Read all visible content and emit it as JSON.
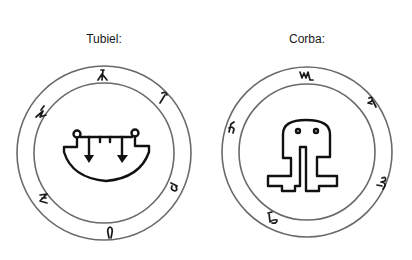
{
  "seals": [
    {
      "name": "Tubiel",
      "label": "Tubiel:",
      "center": [
        104,
        153
      ],
      "outer_radius": 87,
      "inner_radius": 70,
      "ring_glyphs": [
        {
          "position": "top",
          "angle_deg": 0,
          "symbol": "lambda-like glyph"
        },
        {
          "position": "upper-right",
          "angle_deg": 45,
          "symbol": "hook glyph"
        },
        {
          "position": "lower-right",
          "angle_deg": 120,
          "symbol": "b-like glyph"
        },
        {
          "position": "bottom",
          "angle_deg": 180,
          "symbol": "omega-like glyph"
        },
        {
          "position": "lower-left",
          "angle_deg": 235,
          "symbol": "zeta-like glyph"
        },
        {
          "position": "upper-left",
          "angle_deg": 300,
          "symbol": "zigzag glyph"
        }
      ],
      "central_sigil": "bowl with two downward arrows hanging from a bar with circles at both ends"
    },
    {
      "name": "Corba",
      "label": "Corba:",
      "center": [
        307,
        152
      ],
      "outer_radius": 85,
      "inner_radius": 68,
      "ring_glyphs": [
        {
          "position": "top",
          "angle_deg": 0,
          "symbol": "m-like glyph"
        },
        {
          "position": "upper-right",
          "angle_deg": 50,
          "symbol": "curl glyph"
        },
        {
          "position": "lower-right",
          "angle_deg": 115,
          "symbol": "3-like glyph"
        },
        {
          "position": "lower-left",
          "angle_deg": 210,
          "symbol": "b-like glyph"
        },
        {
          "position": "left",
          "angle_deg": 290,
          "symbol": "h-like glyph"
        }
      ],
      "central_sigil": "arched head with two eye dots, two legs ending in square feet"
    }
  ],
  "colors": {
    "background": "#ffffff",
    "ring_stroke": "#6a6a6a",
    "ink": "#111111"
  }
}
